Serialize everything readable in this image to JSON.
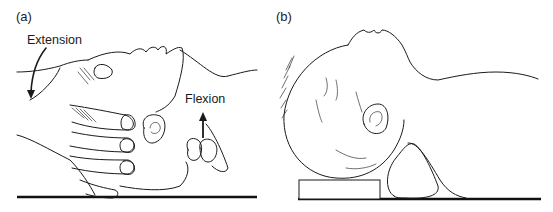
{
  "figure": {
    "panels": [
      {
        "id": "a",
        "label": "(a)",
        "annotations": {
          "extension": "Extension",
          "flexion": "Flexion"
        },
        "description": "Hand tilting infant head into extension; chin lifted (flexion arrow pointing up)"
      },
      {
        "id": "b",
        "label": "(b)",
        "description": "Infant head supported on flat block under occiput with rounded roll under shoulders/neck"
      }
    ],
    "colors": {
      "line": "#1a1a1a",
      "background": "#ffffff",
      "floor": "#111111"
    }
  }
}
